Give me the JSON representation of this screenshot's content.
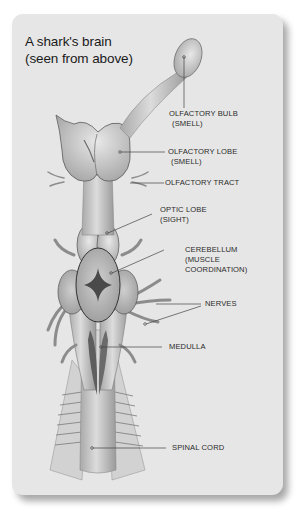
{
  "title": {
    "line1": "A shark's brain",
    "line2": "(seen from above)"
  },
  "labels": {
    "olfactory_bulb": {
      "line1": "OLFACTORY BULB",
      "line2": "(SMELL)"
    },
    "olfactory_lobe": {
      "line1": "OLFACTORY LOBE",
      "line2": "(SMELL)"
    },
    "olfactory_tract": {
      "line1": "OLFACTORY TRACT"
    },
    "optic_lobe": {
      "line1": "OPTIC LOBE",
      "line2": "(SIGHT)"
    },
    "cerebellum": {
      "line1": "CEREBELLUM",
      "line2": "(MUSCLE",
      "line3": "COORDINATION)"
    },
    "nerves": {
      "line1": "NERVES"
    },
    "medulla": {
      "line1": "MEDULLA"
    },
    "spinal_cord": {
      "line1": "SPINAL CORD"
    }
  },
  "colors": {
    "card_bg": "#e6e6e6",
    "text": "#2b2b2b",
    "leader_line": "#444444"
  }
}
